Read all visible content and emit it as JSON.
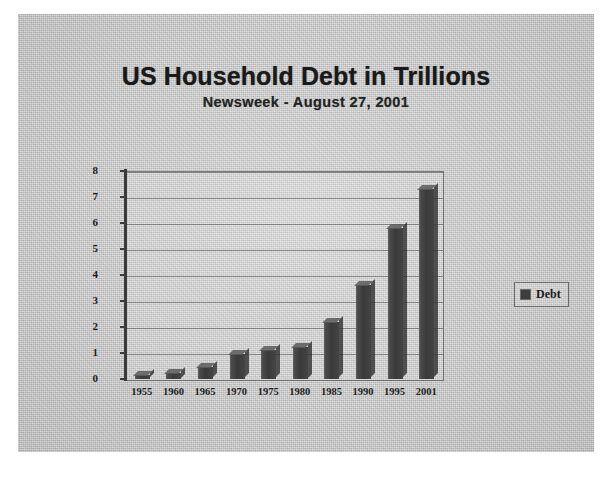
{
  "document": {
    "title": "US Household Debt in Trillions",
    "subtitle": "Newsweek -  August 27, 2001"
  },
  "legend": {
    "label": "Debt",
    "swatch_color": "#3d3d3d",
    "position": "right"
  },
  "colors": {
    "page_background": "#c9c9c9",
    "outer_background": "#ffffff",
    "bar_color": "#3a3a3a",
    "axis_color": "#3b3b3b",
    "grid_color": "#6b6b6b",
    "text_color": "#1a1a1a"
  },
  "chart_data": {
    "type": "bar",
    "title": "US Household Debt in Trillions",
    "subtitle": "Newsweek -  August 27, 2001",
    "xlabel": "",
    "ylabel": "",
    "categories": [
      "1955",
      "1960",
      "1965",
      "1970",
      "1975",
      "1980",
      "1985",
      "1990",
      "1995",
      "2001"
    ],
    "series": [
      {
        "name": "Debt",
        "values": [
          0.15,
          0.25,
          0.45,
          0.95,
          1.1,
          1.25,
          2.2,
          3.6,
          5.8,
          7.3
        ]
      }
    ],
    "ylim": [
      0,
      8
    ],
    "yticks": [
      "0",
      "1",
      "2",
      "3",
      "4",
      "5",
      "6",
      "7",
      "8"
    ],
    "grid": true,
    "legend_position": "right",
    "units": "trillions of US dollars"
  }
}
